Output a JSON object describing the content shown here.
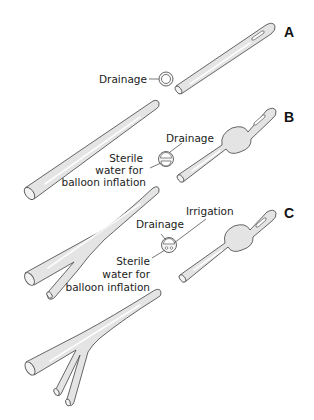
{
  "figure": {
    "panels": [
      {
        "id": "A",
        "label": "A",
        "type": "Straight (single-lumen) catheter",
        "cross_section_labels": [
          "Drainage"
        ]
      },
      {
        "id": "B",
        "label": "B",
        "type": "Indwelling retention (double-lumen) catheter",
        "cross_section_labels": [
          "Drainage",
          "Sterile",
          "water for",
          "balloon inflation"
        ]
      },
      {
        "id": "C",
        "label": "C",
        "type": "Triple-lumen catheter",
        "cross_section_labels": [
          "Irrigation",
          "Drainage",
          "Sterile",
          "water for",
          "balloon inflation"
        ]
      }
    ]
  },
  "labels": {
    "a_drainage": "Drainage",
    "b_drainage": "Drainage",
    "b_sterile_1": "Sterile",
    "b_sterile_2": "water for",
    "b_sterile_3": "balloon inflation",
    "c_irrigation": "Irrigation",
    "c_drainage": "Drainage",
    "c_sterile_1": "Sterile",
    "c_sterile_2": "water for",
    "c_sterile_3": "balloon inflation",
    "panel_a": "A",
    "panel_b": "B",
    "panel_c": "C"
  },
  "colors": {
    "tube_fill": "#e4e4e4",
    "outline": "#555555",
    "text": "#222222",
    "background": "#ffffff"
  }
}
